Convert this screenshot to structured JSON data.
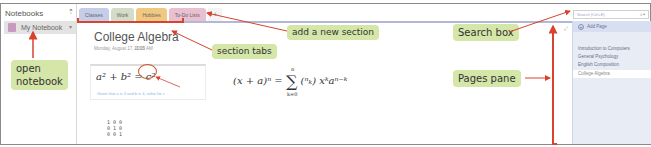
{
  "notebooks": {
    "header": "Notebooks",
    "pin_icon": "pin-icon",
    "items": [
      {
        "label": "My Notebook",
        "color": "#c89ac0"
      }
    ]
  },
  "section_tabs": [
    {
      "label": "Classes",
      "color": "#c5cde8"
    },
    {
      "label": "Work",
      "color": "#d4dcc8"
    },
    {
      "label": "Hobbies",
      "color": "#f0c880"
    },
    {
      "label": "To-Do Lists",
      "color": "#e8c0d0"
    }
  ],
  "add_section_label": "+",
  "page": {
    "title": "College Algebra",
    "date": "Monday, August 17, 2015",
    "time": "11:00 AM",
    "equation_1": "a² + b² = c²",
    "equation_1_hint": "Given that a is 3 and b is 4, solve for c",
    "equation_2_left": "(x + a)ⁿ =",
    "equation_2_sum_top": "n",
    "equation_2_sum_bottom": "k=0",
    "equation_2_right": "(ⁿₖ) xᵏaⁿ⁻ᵏ",
    "matrix": "1 0 0\n0 1 0\n0 0 1"
  },
  "search": {
    "placeholder": "Search (Ctrl+E)",
    "icon": "search-icon"
  },
  "pages_pane": {
    "add_page_label": "Add Page",
    "pages": [
      {
        "label": "Introduction to Computers",
        "active": false
      },
      {
        "label": "General Psychology",
        "active": false
      },
      {
        "label": "English Composition",
        "active": false
      },
      {
        "label": "College Algebra",
        "active": true
      }
    ]
  },
  "callouts": {
    "open_notebook": "open\nnotebook",
    "add_section": "add a new section",
    "section_tabs": "section tabs",
    "search_box": "Search box",
    "pages_pane": "Pages pane"
  },
  "colors": {
    "callout_bg": "#d4e6a8",
    "arrow": "#d9422e",
    "tabline": "#b4b8d8"
  }
}
